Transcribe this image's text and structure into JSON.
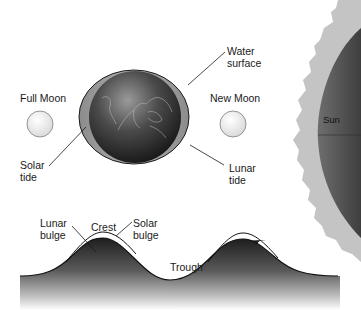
{
  "diagram": {
    "bodies": {
      "full_moon": {
        "label": "Full Moon"
      },
      "new_moon": {
        "label": "New Moon"
      },
      "sun": {
        "label": "Sun"
      },
      "earth": {
        "label": "Earth"
      }
    },
    "callouts": {
      "water_surface": {
        "line1": "Water",
        "line2": "surface"
      },
      "solar_tide": {
        "line1": "Solar",
        "line2": "tide"
      },
      "lunar_tide": {
        "line1": "Lunar",
        "line2": "tide"
      }
    },
    "wave_profile": {
      "lunar_bulge": {
        "line1": "Lunar",
        "line2": "bulge"
      },
      "crest": {
        "label": "Crest"
      },
      "solar_bulge": {
        "line1": "Solar",
        "line2": "bulge"
      },
      "trough": {
        "label": "Trough"
      }
    },
    "colors": {
      "ink": "#1a1a1a",
      "earth_dark": "#1c1c1c",
      "earth_light": "#8a8a8a",
      "water_bulge": "#9b9b9b",
      "moon_fill": "#f4f4f4",
      "sun_disk": "#5a5a5a",
      "corona": "#c4c4c4",
      "wave_dark": "#222222"
    }
  }
}
